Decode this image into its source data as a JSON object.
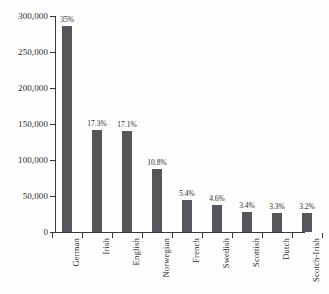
{
  "chart_data": {
    "type": "bar",
    "title": "",
    "xlabel": "",
    "ylabel": "",
    "ylim": [
      0,
      300000
    ],
    "grid": false,
    "legend": null,
    "categories": [
      "German",
      "Irish",
      "English",
      "Norwegian",
      "French",
      "Swedish",
      "Scottish",
      "Dutch",
      "Scotch-Irish"
    ],
    "values": [
      286000,
      141000,
      140000,
      88000,
      44000,
      38000,
      28000,
      27000,
      26000
    ],
    "data_labels": [
      "35%",
      "17.3%",
      "17.1%",
      "10.8%",
      "5.4%",
      "4.6%",
      "3.4%",
      "3.3%",
      "3.2%"
    ],
    "percents": [
      35,
      17.3,
      17.1,
      10.8,
      5.4,
      4.6,
      3.4,
      3.3,
      3.2
    ],
    "yticks": [
      0,
      50000,
      100000,
      150000,
      200000,
      250000,
      300000
    ],
    "ytick_labels": [
      "0",
      "50,000",
      "100,000",
      "150,000",
      "200,000",
      "250,000",
      "300,000"
    ],
    "bar_color": "#56565c",
    "axis_color": "#3a3a3a",
    "background_color": "#fefefe"
  }
}
